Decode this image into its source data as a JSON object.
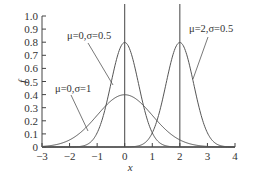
{
  "chart_data": {
    "type": "line",
    "title": "",
    "xlabel": "x",
    "ylabel": "f",
    "xlim": [
      -3,
      4
    ],
    "ylim": [
      0,
      1.0
    ],
    "xticks": [
      "-3",
      "-2",
      "-1",
      "0",
      "1",
      "2",
      "3",
      "4"
    ],
    "yticks": [
      "0",
      "0.1",
      "0.2",
      "0.3",
      "0.4",
      "0.5",
      "0.6",
      "0.7",
      "0.8",
      "0.9",
      "1.0"
    ],
    "grid": false,
    "legend": "none (inline annotations)",
    "series": [
      {
        "name": "μ=0,σ=0.5",
        "mu": 0,
        "sigma": 0.5,
        "peak": 0.8
      },
      {
        "name": "μ=0,σ=1",
        "mu": 0,
        "sigma": 1,
        "peak": 0.4
      },
      {
        "name": "μ=2,σ=0.5",
        "mu": 2,
        "sigma": 0.5,
        "peak": 0.8
      }
    ],
    "vertical_lines": [
      0,
      2
    ],
    "annotations": [
      "μ=0,σ=0.5",
      "μ=0,σ=1",
      "μ=2,σ=0.5"
    ]
  },
  "labels": {
    "x_axis": "x",
    "y_axis": "f",
    "ann1": "μ=0,σ=0.5",
    "ann2": "μ=0,σ=1",
    "ann3": "μ=2,σ=0.5"
  }
}
